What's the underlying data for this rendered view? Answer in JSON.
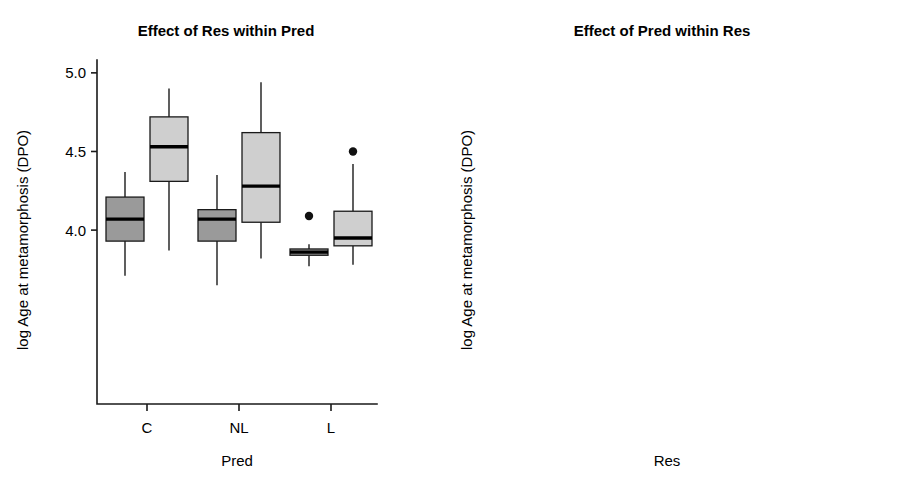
{
  "figure": {
    "width": 904,
    "height": 484,
    "background": "#ffffff"
  },
  "colors": {
    "fill_light": "#cfcfcf",
    "fill_medium": "#9a9a9a",
    "fill_dark": "#595959",
    "stroke": "#1a1a1a",
    "median": "#000000",
    "text": "#000000"
  },
  "panels": {
    "left": {
      "title": "Effect of Res within Pred",
      "xlabel": "Pred",
      "ylabel": "log Age at metamorphosis (DPO)",
      "x_ticks": [
        "C",
        "NL",
        "L"
      ],
      "y_ticks": [
        "5.0",
        "4.5",
        "4.0"
      ],
      "legend": {
        "title": "Res",
        "items": [
          {
            "label": "Hi",
            "color": "#9a9a9a"
          },
          {
            "label": "Lo",
            "color": "#cfcfcf"
          }
        ]
      }
    },
    "right": {
      "title": "Effect of Pred within Res",
      "xlabel": "Res",
      "ylabel": "log Age at metamorphosis (DPO)",
      "x_ticks": [
        "Hi",
        "Lo"
      ],
      "y_ticks": [
        "5.0",
        "4.5",
        "4.0"
      ],
      "legend": {
        "title": "Pred",
        "items": [
          {
            "label": "C",
            "color": "#cfcfcf"
          },
          {
            "label": "NL",
            "color": "#9a9a9a"
          },
          {
            "label": "L",
            "color": "#595959"
          }
        ]
      }
    }
  },
  "chart_data": [
    {
      "type": "box",
      "panel": "left",
      "title": "Effect of Res within Pred",
      "xlabel": "Pred",
      "ylabel": "log Age at metamorphosis (DPO)",
      "categories": [
        "C",
        "NL",
        "L"
      ],
      "group_by": "Res",
      "ylim": [
        3.6,
        5.05
      ],
      "yticks": [
        5.0,
        4.5,
        4.0
      ],
      "grid": false,
      "legend_position": "right",
      "series": [
        {
          "name": "Hi",
          "color": "#9a9a9a",
          "boxes": [
            {
              "category": "C",
              "whisker_low": 3.71,
              "q1": 3.93,
              "median": 4.07,
              "q3": 4.21,
              "whisker_high": 4.37,
              "outliers": []
            },
            {
              "category": "NL",
              "whisker_low": 3.65,
              "q1": 3.93,
              "median": 4.07,
              "q3": 4.13,
              "whisker_high": 4.35,
              "outliers": []
            },
            {
              "category": "L",
              "whisker_low": 3.77,
              "q1": 3.84,
              "median": 3.86,
              "q3": 3.88,
              "whisker_high": 3.91,
              "outliers": [
                4.09
              ]
            }
          ]
        },
        {
          "name": "Lo",
          "color": "#cfcfcf",
          "boxes": [
            {
              "category": "C",
              "whisker_low": 3.87,
              "q1": 4.31,
              "median": 4.53,
              "q3": 4.72,
              "whisker_high": 4.9,
              "outliers": []
            },
            {
              "category": "NL",
              "whisker_low": 3.82,
              "q1": 4.05,
              "median": 4.28,
              "q3": 4.62,
              "whisker_high": 4.94,
              "outliers": []
            },
            {
              "category": "L",
              "whisker_low": 3.78,
              "q1": 3.9,
              "median": 3.95,
              "q3": 4.12,
              "whisker_high": 4.42,
              "outliers": [
                4.5
              ]
            }
          ]
        }
      ]
    },
    {
      "type": "box",
      "panel": "right",
      "title": "Effect of Pred within Res",
      "xlabel": "Res",
      "ylabel": "log Age at metamorphosis (DPO)",
      "categories": [
        "Hi",
        "Lo"
      ],
      "group_by": "Pred",
      "ylim": [
        3.6,
        5.05
      ],
      "yticks": [
        5.0,
        4.5,
        4.0
      ],
      "grid": false,
      "legend_position": "right",
      "series": [
        {
          "name": "C",
          "color": "#cfcfcf",
          "boxes": [
            {
              "category": "Hi",
              "whisker_low": 3.71,
              "q1": 3.93,
              "median": 4.07,
              "q3": 4.21,
              "whisker_high": 4.37,
              "outliers": []
            },
            {
              "category": "Lo",
              "whisker_low": 3.87,
              "q1": 4.31,
              "median": 4.53,
              "q3": 4.72,
              "whisker_high": 4.9,
              "outliers": []
            }
          ]
        },
        {
          "name": "NL",
          "color": "#9a9a9a",
          "boxes": [
            {
              "category": "Hi",
              "whisker_low": 3.65,
              "q1": 3.93,
              "median": 4.07,
              "q3": 4.13,
              "whisker_high": 4.35,
              "outliers": []
            },
            {
              "category": "Lo",
              "whisker_low": 3.82,
              "q1": 4.05,
              "median": 4.28,
              "q3": 4.62,
              "whisker_high": 4.94,
              "outliers": []
            }
          ]
        },
        {
          "name": "L",
          "color": "#595959",
          "boxes": [
            {
              "category": "Hi",
              "whisker_low": 3.77,
              "q1": 3.84,
              "median": 3.86,
              "q3": 3.88,
              "whisker_high": 3.91,
              "outliers": [
                4.09
              ]
            },
            {
              "category": "Lo",
              "whisker_low": 3.78,
              "q1": 3.9,
              "median": 3.95,
              "q3": 4.12,
              "whisker_high": 4.42,
              "outliers": [
                4.5
              ]
            }
          ]
        }
      ]
    }
  ]
}
